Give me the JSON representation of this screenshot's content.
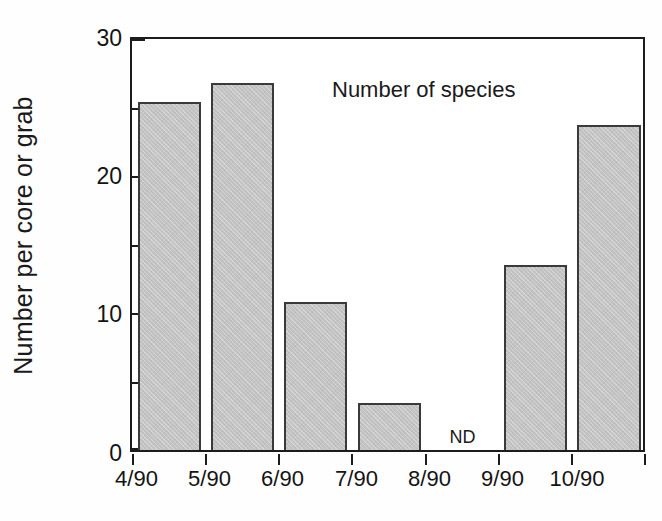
{
  "chart_data": {
    "type": "bar",
    "title": "",
    "annotation": "Number of species",
    "xlabel": "",
    "ylabel": "Number per core or grab",
    "categories": [
      "4/90",
      "5/90",
      "6/90",
      "7/90",
      "8/90",
      "9/90",
      "10/90"
    ],
    "values": [
      25.4,
      26.8,
      10.8,
      3.4,
      null,
      13.5,
      23.7
    ],
    "missing_label": "ND",
    "missing_categories": [
      "8/90"
    ],
    "ylim": [
      0,
      30
    ],
    "ytick_major": [
      0,
      10,
      20,
      30
    ],
    "ytick_minor": [
      5,
      15,
      25
    ],
    "ytick_labels": [
      "0",
      "10",
      "20",
      "30"
    ],
    "grid": false,
    "legend": false,
    "legend_position": "none",
    "bar_fill_color": "#c3c3c3",
    "bar_edge_color": "#3a3a3a",
    "axis_color": "#1c1c1c",
    "background_color": "#ffffff"
  }
}
